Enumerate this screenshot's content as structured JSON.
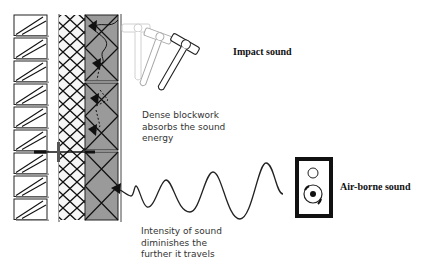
{
  "diagram": {
    "type": "wall-section-sound-insulation",
    "labels": {
      "impact_sound": "Impact sound",
      "airborne_sound": "Air-borne sound",
      "blockwork": [
        "Dense blockwork",
        "absorbs the sound",
        "energy"
      ],
      "intensity": [
        "Intensity of sound",
        "diminishes the",
        "further it travels"
      ]
    },
    "layers": [
      {
        "name": "brick-outer-leaf",
        "count": 9,
        "fill": "#ffffff"
      },
      {
        "name": "insulation-cavity",
        "pattern": "cross-hatch",
        "fill": "#ffffff"
      },
      {
        "name": "dense-blockwork",
        "count": 3,
        "fill": "#9a9a9a"
      }
    ],
    "colors": {
      "line": "#111111",
      "block_fill": "#9a9a9a",
      "faded_hammer": "#cccccc",
      "text": "#333333"
    },
    "icons": [
      "hammer-icon",
      "speaker-icon",
      "sound-wave",
      "arrow-icon"
    ]
  }
}
